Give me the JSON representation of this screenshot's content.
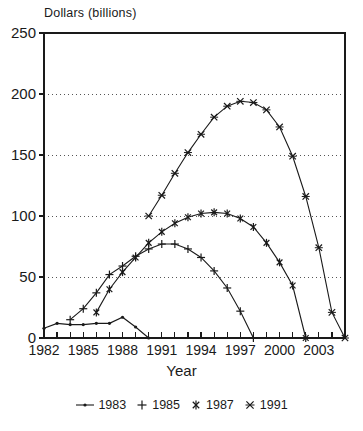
{
  "chart_data": {
    "type": "line",
    "title": "Dollars (billions)",
    "xlabel": "Year",
    "ylabel": "Dollars (billions)",
    "xlim": [
      1982,
      2005
    ],
    "ylim": [
      0,
      250
    ],
    "yticks": [
      0,
      50,
      100,
      150,
      200,
      250
    ],
    "xticks": [
      1982,
      1983,
      1984,
      1985,
      1986,
      1987,
      1988,
      1989,
      1990,
      1991,
      1992,
      1993,
      1994,
      1995,
      1996,
      1997,
      1998,
      1999,
      2000,
      2001,
      2002,
      2003,
      2004,
      2005
    ],
    "xtick_labels": [
      "1982",
      "",
      "",
      "1985",
      "",
      "",
      "1988",
      "",
      "",
      "1991",
      "",
      "",
      "1994",
      "",
      "",
      "1997",
      "",
      "",
      "2000",
      "",
      "",
      "2003",
      "",
      ""
    ],
    "ytick_labels": [
      "0",
      "50",
      "100",
      "150",
      "200",
      "250"
    ],
    "grid": "horizontal-dotted",
    "legend_position": "bottom",
    "line_color": "#1a1a1a",
    "grid_color": "#555555",
    "frame_color": "#1a1a1a",
    "background": "#ffffff",
    "series": [
      {
        "name": "1983",
        "marker": "dot",
        "x": [
          1982,
          1983,
          1984,
          1985,
          1986,
          1987,
          1988,
          1989,
          1990
        ],
        "values": [
          8,
          12,
          11,
          11,
          12,
          12,
          17,
          9,
          0
        ]
      },
      {
        "name": "1985",
        "marker": "plus",
        "x": [
          1984,
          1985,
          1986,
          1987,
          1988,
          1989,
          1990,
          1991,
          1992,
          1993,
          1994,
          1995,
          1996,
          1997,
          1998
        ],
        "values": [
          15,
          24,
          37,
          52,
          59,
          67,
          73,
          77,
          77,
          73,
          66,
          55,
          41,
          22,
          0
        ]
      },
      {
        "name": "1987",
        "marker": "asterisk",
        "x": [
          1986,
          1987,
          1988,
          1989,
          1990,
          1991,
          1992,
          1993,
          1994,
          1995,
          1996,
          1997,
          1998,
          1999,
          2000,
          2001,
          2002
        ],
        "values": [
          21,
          40,
          54,
          66,
          78,
          87,
          94,
          99,
          102,
          103,
          102,
          98,
          91,
          78,
          62,
          43,
          0
        ]
      },
      {
        "name": "1991",
        "marker": "x-asterisk",
        "x": [
          1990,
          1991,
          1992,
          1993,
          1994,
          1995,
          1996,
          1997,
          1998,
          1999,
          2000,
          2001,
          2002,
          2003,
          2004,
          2005
        ],
        "values": [
          100,
          117,
          135,
          152,
          167,
          181,
          190,
          194,
          193,
          187,
          173,
          149,
          116,
          74,
          21,
          0
        ]
      }
    ]
  },
  "legend": {
    "items": [
      {
        "label": "1983",
        "marker": "dot"
      },
      {
        "label": "1985",
        "marker": "plus"
      },
      {
        "label": "1987",
        "marker": "asterisk"
      },
      {
        "label": "1991",
        "marker": "x-asterisk"
      }
    ]
  }
}
